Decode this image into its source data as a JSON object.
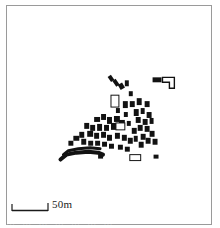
{
  "figure": {
    "type": "archaeological-site-plan",
    "title": "",
    "frame": {
      "color": "#9a9a9a",
      "x": 6,
      "y": 5,
      "width": 206,
      "height": 220
    }
  },
  "scale": {
    "label": "50m",
    "bar_length_px": 36,
    "units": "m",
    "value": 50
  },
  "caption": {
    "text": "…   …  …  …              …        …   …",
    "clipped": true
  },
  "colors": {
    "structure_fill": "#121212",
    "structure_outline": "#121212",
    "background": "#ffffff",
    "frame": "#9a9a9a"
  },
  "map_data": {
    "filled_structures": [
      {
        "x": 103,
        "y": 70,
        "w": 4,
        "h": 6,
        "r": -35
      },
      {
        "x": 108,
        "y": 74,
        "w": 4,
        "h": 7,
        "r": -35
      },
      {
        "x": 113,
        "y": 78,
        "w": 5,
        "h": 6,
        "r": -30
      },
      {
        "x": 119,
        "y": 75,
        "w": 4,
        "h": 6,
        "r": 0
      },
      {
        "x": 117,
        "y": 96,
        "w": 5,
        "h": 7,
        "r": 0
      },
      {
        "x": 124,
        "y": 96,
        "w": 5,
        "h": 6,
        "r": 0
      },
      {
        "x": 131,
        "y": 93,
        "w": 5,
        "h": 7,
        "r": 0
      },
      {
        "x": 139,
        "y": 96,
        "w": 5,
        "h": 6,
        "r": 0
      },
      {
        "x": 128,
        "y": 104,
        "w": 5,
        "h": 7,
        "r": 0
      },
      {
        "x": 135,
        "y": 103,
        "w": 4,
        "h": 6,
        "r": 0
      },
      {
        "x": 141,
        "y": 107,
        "w": 5,
        "h": 6,
        "r": 0
      },
      {
        "x": 130,
        "y": 112,
        "w": 5,
        "h": 6,
        "r": 0
      },
      {
        "x": 137,
        "y": 114,
        "w": 5,
        "h": 6,
        "r": 0
      },
      {
        "x": 144,
        "y": 113,
        "w": 4,
        "h": 6,
        "r": 0
      },
      {
        "x": 132,
        "y": 120,
        "w": 5,
        "h": 6,
        "r": 0
      },
      {
        "x": 139,
        "y": 121,
        "w": 5,
        "h": 6,
        "r": 0
      },
      {
        "x": 126,
        "y": 123,
        "w": 5,
        "h": 6,
        "r": 0
      },
      {
        "x": 144,
        "y": 126,
        "w": 5,
        "h": 6,
        "r": 0
      },
      {
        "x": 135,
        "y": 129,
        "w": 5,
        "h": 6,
        "r": 0
      },
      {
        "x": 128,
        "y": 131,
        "w": 4,
        "h": 6,
        "r": 0
      },
      {
        "x": 140,
        "y": 133,
        "w": 5,
        "h": 6,
        "r": 0
      },
      {
        "x": 147,
        "y": 134,
        "w": 5,
        "h": 6,
        "r": 0
      },
      {
        "x": 133,
        "y": 137,
        "w": 5,
        "h": 6,
        "r": 0
      },
      {
        "x": 88,
        "y": 112,
        "w": 6,
        "h": 5,
        "r": 0
      },
      {
        "x": 95,
        "y": 109,
        "w": 5,
        "h": 6,
        "r": 0
      },
      {
        "x": 101,
        "y": 112,
        "w": 5,
        "h": 7,
        "r": 0
      },
      {
        "x": 108,
        "y": 111,
        "w": 6,
        "h": 6,
        "r": 0
      },
      {
        "x": 113,
        "y": 115,
        "w": 6,
        "h": 6,
        "r": 0
      },
      {
        "x": 105,
        "y": 118,
        "w": 7,
        "h": 7,
        "r": 0
      },
      {
        "x": 98,
        "y": 120,
        "w": 5,
        "h": 6,
        "r": 0
      },
      {
        "x": 91,
        "y": 119,
        "w": 5,
        "h": 7,
        "r": 0
      },
      {
        "x": 84,
        "y": 120,
        "w": 5,
        "h": 6,
        "r": 0
      },
      {
        "x": 78,
        "y": 118,
        "w": 5,
        "h": 6,
        "r": 0
      },
      {
        "x": 81,
        "y": 126,
        "w": 6,
        "h": 6,
        "r": 0
      },
      {
        "x": 88,
        "y": 128,
        "w": 5,
        "h": 6,
        "r": 0
      },
      {
        "x": 95,
        "y": 127,
        "w": 5,
        "h": 6,
        "r": 0
      },
      {
        "x": 101,
        "y": 130,
        "w": 5,
        "h": 6,
        "r": 0
      },
      {
        "x": 109,
        "y": 128,
        "w": 5,
        "h": 6,
        "r": 0
      },
      {
        "x": 116,
        "y": 130,
        "w": 5,
        "h": 6,
        "r": 0
      },
      {
        "x": 122,
        "y": 133,
        "w": 5,
        "h": 6,
        "r": 0
      },
      {
        "x": 73,
        "y": 127,
        "w": 5,
        "h": 6,
        "r": 0
      },
      {
        "x": 67,
        "y": 131,
        "w": 6,
        "h": 5,
        "r": 0
      },
      {
        "x": 75,
        "y": 134,
        "w": 5,
        "h": 6,
        "r": 0
      },
      {
        "x": 82,
        "y": 136,
        "w": 5,
        "h": 5,
        "r": 0
      },
      {
        "x": 89,
        "y": 136,
        "w": 5,
        "h": 5,
        "r": 0
      },
      {
        "x": 96,
        "y": 137,
        "w": 5,
        "h": 5,
        "r": 0
      },
      {
        "x": 103,
        "y": 139,
        "w": 5,
        "h": 5,
        "r": 0
      },
      {
        "x": 112,
        "y": 140,
        "w": 5,
        "h": 5,
        "r": 0
      },
      {
        "x": 119,
        "y": 142,
        "w": 5,
        "h": 5,
        "r": 0
      },
      {
        "x": 62,
        "y": 136,
        "w": 5,
        "h": 5,
        "r": 0
      },
      {
        "x": 92,
        "y": 150,
        "w": 5,
        "h": 4,
        "r": 0
      },
      {
        "x": 148,
        "y": 150,
        "w": 5,
        "h": 4,
        "r": 0
      },
      {
        "x": 110,
        "y": 103,
        "w": 4,
        "h": 5,
        "r": 0
      },
      {
        "x": 118,
        "y": 107,
        "w": 4,
        "h": 5,
        "r": 0
      },
      {
        "x": 121,
        "y": 116,
        "w": 4,
        "h": 5,
        "r": 0
      },
      {
        "x": 123,
        "y": 86,
        "w": 4,
        "h": 5,
        "r": 0
      }
    ],
    "wall_lines": [
      {
        "points": "54,155 60,150 70,148 82,147 92,148 97,150",
        "width": 4
      },
      {
        "points": "57,150 62,146 72,144 84,143 94,144",
        "width": 3
      }
    ],
    "outlined_structures": [
      {
        "x": 105,
        "y": 90,
        "w": 8,
        "h": 12,
        "name": "outlined-rect-upper"
      },
      {
        "x": 124,
        "y": 150,
        "w": 11,
        "h": 6,
        "name": "outlined-rect-lower"
      },
      {
        "x": 110,
        "y": 118,
        "w": 9,
        "h": 7,
        "name": "outlined-rect-center"
      }
    ],
    "lshape_building": {
      "name": "l-shaped-compound",
      "path": "M 157,72 L 169,72 L 169,83 L 164,83 L 164,77 L 157,77 Z",
      "annex": {
        "x": 147,
        "y": 72,
        "w": 9,
        "h": 5
      }
    }
  }
}
